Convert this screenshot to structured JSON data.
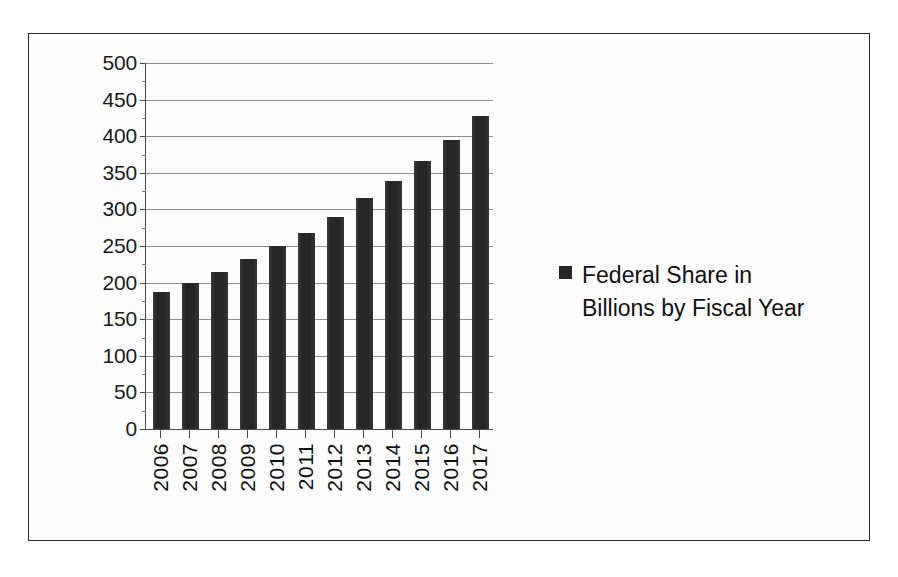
{
  "chart_data": {
    "type": "bar",
    "title": "",
    "xlabel": "",
    "ylabel": "",
    "categories": [
      "2006",
      "2007",
      "2008",
      "2009",
      "2010",
      "2011",
      "2012",
      "2013",
      "2014",
      "2015",
      "2016",
      "2017"
    ],
    "values": [
      187,
      199,
      214,
      232,
      250,
      268,
      290,
      315,
      339,
      366,
      395,
      427
    ],
    "series": [
      {
        "name": "Federal Share in Billions by Fiscal Year",
        "values": [
          187,
          199,
          214,
          232,
          250,
          268,
          290,
          315,
          339,
          366,
          395,
          427
        ]
      }
    ],
    "ylim": [
      0,
      500
    ],
    "ytick_values": [
      0,
      50,
      100,
      150,
      200,
      250,
      300,
      350,
      400,
      450,
      500
    ],
    "ytick_labels": [
      "0",
      "50",
      "100",
      "150",
      "200",
      "250",
      "300",
      "350",
      "400",
      "450",
      "500"
    ],
    "grid": true,
    "legend_position": "right",
    "bar_color": "#262626",
    "gridline_color": "#8d8d8d",
    "axis_color": "#4a4a4a",
    "frame_color": "#2b2b2b"
  },
  "legend": {
    "entries": [
      {
        "label": "Federal Share in Billions by Fiscal Year",
        "color": "#262626",
        "marker": "square-marker"
      }
    ]
  }
}
